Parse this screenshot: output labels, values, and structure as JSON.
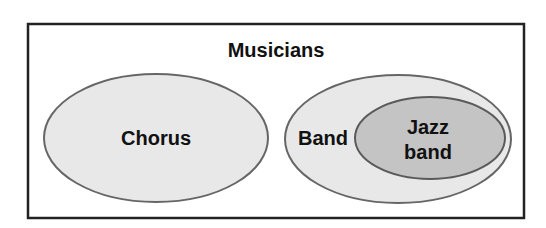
{
  "diagram": {
    "type": "venn",
    "title": "Musicians",
    "sets": [
      {
        "id": "chorus",
        "label": "Chorus"
      },
      {
        "id": "band",
        "label": "Band"
      },
      {
        "id": "jazz",
        "label_line1": "Jazz",
        "label_line2": "band",
        "subset_of": "band"
      }
    ]
  },
  "colors": {
    "frame": "#222222",
    "outer_fill": "#e8e8e8",
    "outer_stroke": "#666666",
    "inner_fill": "#c4c4c4",
    "inner_stroke": "#5a5a5a",
    "text": "#111111"
  }
}
